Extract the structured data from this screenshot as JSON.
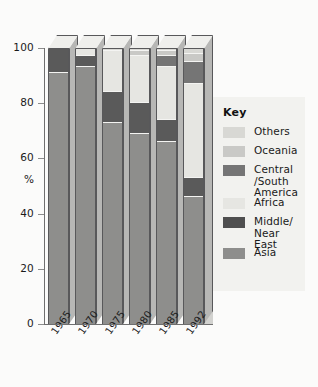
{
  "chart_data": {
    "type": "bar",
    "subtype": "stacked-100-percent-3d",
    "title": "",
    "xlabel": "",
    "ylabel": "%",
    "ylim": [
      0,
      100
    ],
    "yticks": [
      0,
      20,
      40,
      60,
      80,
      100
    ],
    "ytick_labels": [
      "0",
      "20",
      "40",
      "60",
      "80",
      "100"
    ],
    "grid": false,
    "legend_position": "right",
    "legend_title": "Key",
    "categories": [
      "1965",
      "1970",
      "1975",
      "1980",
      "1985",
      "1992"
    ],
    "stack_order_bottom_to_top": [
      "Asia",
      "Middle/Near East",
      "Africa",
      "Central/South America",
      "Oceania",
      "Others"
    ],
    "series": [
      {
        "name": "Asia",
        "color": "#8e8e8c",
        "values": [
          91,
          93,
          73,
          69,
          66,
          46
        ]
      },
      {
        "name": "Middle/Near East",
        "color": "#5a5a5a",
        "values": [
          9,
          4,
          11,
          11,
          8,
          7
        ]
      },
      {
        "name": "Africa",
        "color": "#e6e6e2",
        "values": [
          0,
          3,
          15,
          17,
          19,
          34
        ]
      },
      {
        "name": "Central/South America",
        "color": "#757575",
        "values": [
          0,
          0,
          0,
          0,
          4,
          8
        ]
      },
      {
        "name": "Oceania",
        "color": "#c9c9c6",
        "values": [
          0,
          0,
          0,
          2,
          2,
          3
        ]
      },
      {
        "name": "Others",
        "color": "#d8d8d4",
        "values": [
          0,
          0,
          1,
          1,
          1,
          2
        ]
      }
    ]
  },
  "axis": {
    "y_unit_label": "%",
    "ytick_labels": [
      "100",
      "80",
      "60",
      "40",
      "20",
      "0"
    ]
  },
  "legend": {
    "title": "Key",
    "items": [
      {
        "label": "Others",
        "color": "#d8d8d4"
      },
      {
        "label": "Oceania",
        "color": "#c9c9c6"
      },
      {
        "label": "Central\n/South\nAmerica",
        "color": "#757575"
      },
      {
        "label": "Africa",
        "color": "#e6e6e2"
      },
      {
        "label": "Middle/\nNear East",
        "color": "#4f4f4f"
      },
      {
        "label": "Asia",
        "color": "#8e8e8c"
      }
    ]
  }
}
